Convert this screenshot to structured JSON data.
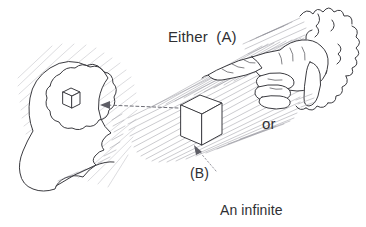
{
  "figure": {
    "title": "Either (A) or (B) An infinite causal series",
    "background_color": "#ffffff",
    "ink_color": "#3b3b40",
    "text_color": "#2f2f33",
    "hatch_color": "#8a8a93",
    "style": "hand-drawn pen and ink line diagram with cross-hatching"
  },
  "labels": {
    "either": "Either  (A)",
    "or": "or",
    "b_tag": "(B)",
    "series_line_1": "An infinite",
    "series_line_2": "causal series"
  },
  "elements": {
    "head": {
      "name": "human head in profile facing right",
      "contains": "brain outline with small cube inside"
    },
    "brain_cube": {
      "name": "small cube inside the brain",
      "meaning": "mental representation of the cube"
    },
    "central_cube": {
      "name": "large cube resting on the causal band",
      "meaning": "the object being perceived or caused"
    },
    "hand": {
      "name": "hand with pointing index finger emerging from clouds",
      "meaning": "first cause / divine hand"
    },
    "clouds": {
      "name": "scalloped cloud outlines at right edge"
    },
    "causal_band": {
      "name": "hatched diagonal band running from hand to head",
      "meaning": "the causal series"
    },
    "arrow_to_head": {
      "name": "dashed arrow pointing left from cube to head",
      "direction": "right-to-left"
    },
    "pointer_to_cube": {
      "name": "dotted leader arrow pointing up-left from the (B) label to the cube",
      "direction": "lower-right to upper-left"
    }
  }
}
